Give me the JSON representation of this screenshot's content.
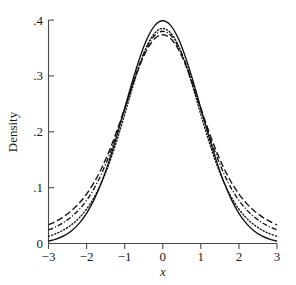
{
  "figure": {
    "background_color": "#ffffff",
    "ink_color": "#111111",
    "axis_color": "#4a4a4a"
  },
  "axes": {
    "x_title": "x",
    "y_title": "Density",
    "x_ticks": [
      "−3",
      "−2",
      "−1",
      "0",
      "1",
      "2",
      "3"
    ],
    "y_ticks": [
      "0",
      ".1",
      ".2",
      ".3",
      ".4"
    ]
  },
  "chart_data": {
    "type": "line",
    "title": "",
    "subtitle": "",
    "xlabel": "x",
    "ylabel": "Density",
    "xlim": [
      -3,
      3
    ],
    "ylim": [
      0,
      0.4
    ],
    "xticks": [
      -3,
      -2,
      -1,
      0,
      1,
      2,
      3
    ],
    "xticklabels": [
      "−3",
      "−2",
      "−1",
      "0",
      "1",
      "2",
      "3"
    ],
    "yticks": [
      0,
      0.1,
      0.2,
      0.3,
      0.4
    ],
    "yticklabels": [
      "0",
      ".1",
      ".2",
      ".3",
      ".4"
    ],
    "grid": false,
    "legend": "none",
    "annotations": [],
    "x": [
      -3.0,
      -2.8,
      -2.6,
      -2.4,
      -2.2,
      -2.0,
      -1.8,
      -1.6,
      -1.4,
      -1.2,
      -1.0,
      -0.8,
      -0.6,
      -0.4,
      -0.2,
      0.0,
      0.2,
      0.4,
      0.6,
      0.8,
      1.0,
      1.2,
      1.4,
      1.6,
      1.8,
      2.0,
      2.2,
      2.4,
      2.6,
      2.8,
      3.0
    ],
    "series": [
      {
        "name": "solid",
        "linestyle": "solid",
        "peak": 0.399,
        "values": [
          0.0044,
          0.0079,
          0.0136,
          0.0224,
          0.0355,
          0.054,
          0.079,
          0.1109,
          0.1497,
          0.1942,
          0.242,
          0.2897,
          0.3332,
          0.3683,
          0.391,
          0.3989,
          0.391,
          0.3683,
          0.3332,
          0.2897,
          0.242,
          0.1942,
          0.1497,
          0.1109,
          0.079,
          0.054,
          0.0355,
          0.0224,
          0.0136,
          0.0079,
          0.0044
        ]
      },
      {
        "name": "dotted",
        "linestyle": "dotted",
        "peak": 0.393,
        "values": [
          0.0128,
          0.0177,
          0.0243,
          0.0333,
          0.0454,
          0.0616,
          0.0829,
          0.1103,
          0.1446,
          0.1854,
          0.231,
          0.2779,
          0.3213,
          0.3559,
          0.3776,
          0.385,
          0.3776,
          0.3559,
          0.3213,
          0.2779,
          0.231,
          0.1854,
          0.1446,
          0.1103,
          0.0829,
          0.0616,
          0.0454,
          0.0333,
          0.0243,
          0.0177,
          0.0128
        ]
      },
      {
        "name": "dash-dot",
        "linestyle": "dashdot",
        "peak": 0.388,
        "values": [
          0.0242,
          0.0302,
          0.0378,
          0.0476,
          0.0605,
          0.0772,
          0.0988,
          0.1261,
          0.1593,
          0.1979,
          0.2402,
          0.2831,
          0.3226,
          0.3539,
          0.3734,
          0.38,
          0.3734,
          0.3539,
          0.3226,
          0.2831,
          0.2402,
          0.1979,
          0.1593,
          0.1261,
          0.0988,
          0.0772,
          0.0605,
          0.0476,
          0.0378,
          0.0302,
          0.0242
        ]
      },
      {
        "name": "dashed",
        "linestyle": "dashed",
        "peak": 0.382,
        "values": [
          0.0335,
          0.04,
          0.0482,
          0.0586,
          0.0718,
          0.0886,
          0.1097,
          0.1356,
          0.1667,
          0.2026,
          0.242,
          0.2821,
          0.3192,
          0.3489,
          0.3674,
          0.3738,
          0.3674,
          0.3489,
          0.3192,
          0.2821,
          0.242,
          0.2026,
          0.1667,
          0.1356,
          0.1097,
          0.0886,
          0.0718,
          0.0586,
          0.0482,
          0.04,
          0.0335
        ]
      }
    ]
  }
}
